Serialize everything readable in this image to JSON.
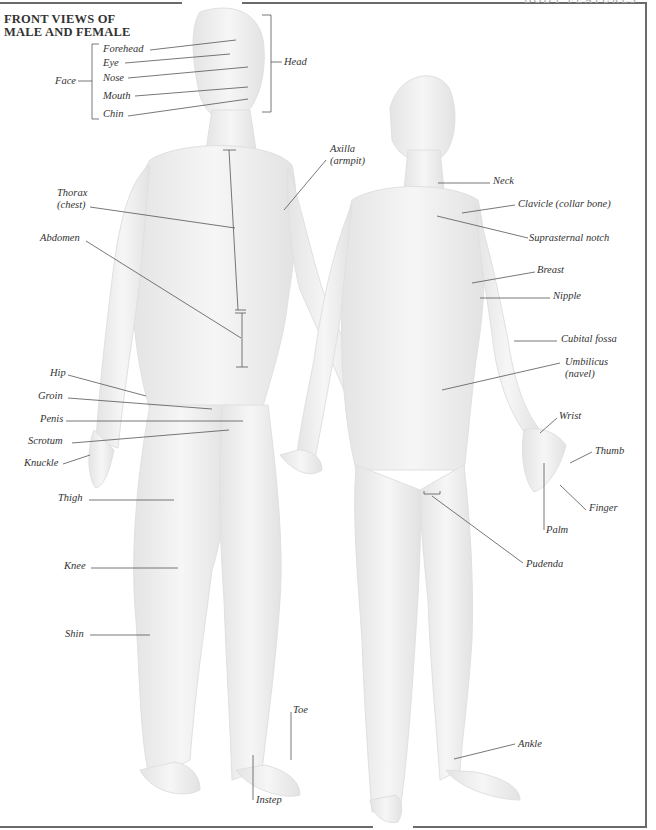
{
  "header": {
    "title_line1": "FRONT VIEWS OF",
    "title_line2": "MALE AND FEMALE",
    "section_header_cut": "BODY FEATURES"
  },
  "colors": {
    "text": "#333333",
    "leader_line": "#555555",
    "rule": "#6a6a6a",
    "figure_fill": "#f1f1f1",
    "figure_shade": "#e2e2e2"
  },
  "labels": {
    "face_group": "Face",
    "forehead": "Forehead",
    "eye": "Eye",
    "nose": "Nose",
    "mouth": "Mouth",
    "chin": "Chin",
    "head": "Head",
    "axilla_1": "Axilla",
    "axilla_2": "(armpit)",
    "thorax_1": "Thorax",
    "thorax_2": "(chest)",
    "abdomen": "Abdomen",
    "hip": "Hip",
    "groin": "Groin",
    "penis": "Penis",
    "scrotum": "Scrotum",
    "knuckle": "Knuckle",
    "thigh": "Thigh",
    "knee": "Knee",
    "shin": "Shin",
    "toe": "Toe",
    "instep": "Instep",
    "neck": "Neck",
    "clavicle": "Clavicle (collar bone)",
    "suprasternal_notch": "Suprasternal notch",
    "breast": "Breast",
    "nipple": "Nipple",
    "cubital_fossa": "Cubital fossa",
    "umbilicus_1": "Umbilicus",
    "umbilicus_2": "(navel)",
    "wrist": "Wrist",
    "thumb": "Thumb",
    "finger": "Finger",
    "palm": "Palm",
    "pudenda": "Pudenda",
    "ankle": "Ankle"
  }
}
